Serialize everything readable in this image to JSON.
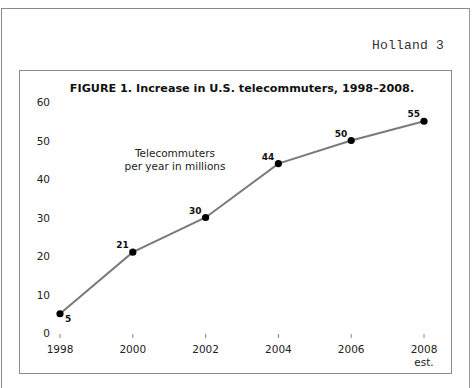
{
  "page": {
    "running_head": "Holland 3"
  },
  "chart_data": {
    "type": "line",
    "title": "FIGURE 1. Increase in U.S. telecommuters, 1998–2008.",
    "xlabel": "",
    "ylabel": "",
    "annotation": [
      "Telecommuters",
      "per year in millions"
    ],
    "categories": [
      "1998",
      "2000",
      "2002",
      "2004",
      "2006",
      "2008"
    ],
    "category_sublabels": [
      "",
      "",
      "",
      "",
      "",
      "est."
    ],
    "series": [
      {
        "name": "Telecommuters per year in millions",
        "values": [
          5,
          21,
          30,
          44,
          50,
          55
        ],
        "data_labels": [
          "5",
          "21",
          "30",
          "44",
          "50",
          "55"
        ],
        "color": "#7a7a7a",
        "marker_color": "#000000"
      }
    ],
    "yticks": [
      "0",
      "10",
      "20",
      "30",
      "40",
      "50",
      "60"
    ],
    "ylim": [
      0,
      60
    ],
    "grid": false,
    "legend": "none"
  }
}
